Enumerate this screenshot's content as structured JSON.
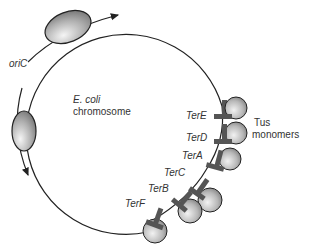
{
  "diagram": {
    "chromosome_label_species": "E. coli",
    "chromosome_label_text": "chromosome",
    "origin_label": "oriC",
    "protein_label_line1": "Tus",
    "protein_label_line2": "monomers",
    "ter_sites": [
      {
        "name": "TerE"
      },
      {
        "name": "TerD"
      },
      {
        "name": "TerA"
      },
      {
        "name": "TerC"
      },
      {
        "name": "TerB"
      },
      {
        "name": "TerF"
      }
    ],
    "colors": {
      "line": "#222222",
      "ter_block": "#555555",
      "sphere_light": "#eeeeee",
      "sphere_dark": "#8a8a8a"
    }
  }
}
